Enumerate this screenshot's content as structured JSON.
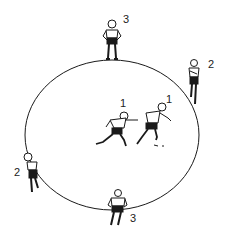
{
  "diagram": {
    "type": "drill-formation",
    "boundary": "circle",
    "players": [
      {
        "id": "top",
        "label": "3",
        "position": "top of circle, standing"
      },
      {
        "id": "right",
        "label": "2",
        "position": "right edge of circle, standing"
      },
      {
        "id": "center-left",
        "label": "1",
        "position": "center, running"
      },
      {
        "id": "center-right",
        "label": "1",
        "position": "center, running ahead"
      },
      {
        "id": "left",
        "label": "2",
        "position": "lower-left edge of circle, standing"
      },
      {
        "id": "bottom",
        "label": "3",
        "position": "bottom of circle, standing",
        "shirt_number": "5"
      }
    ]
  },
  "colors": {
    "ink": "#1a1a1a",
    "background": "#ffffff"
  }
}
